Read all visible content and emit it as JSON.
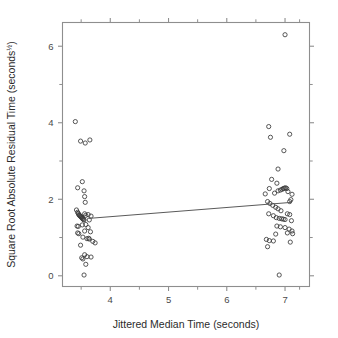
{
  "figure": {
    "width": 338,
    "height": 338,
    "background": "#ffffff",
    "point_color": "#3a3a3a",
    "line_color": "#5a5a5a",
    "axis_color": "#8e8e8e"
  },
  "chart_data": {
    "type": "scatter",
    "title": "",
    "xlabel": "Jittered Median Time (seconds)",
    "ylabel": "Square Root Absolute Residual Time (seconds",
    "ylabel_superscript": "½",
    "ylabel_suffix": ")",
    "xlim": [
      3.18,
      7.42
    ],
    "ylim": [
      -0.28,
      6.62
    ],
    "xticks": [
      4,
      5,
      6,
      7
    ],
    "xtick_labels": [
      "4",
      "5",
      "6",
      "7"
    ],
    "xticks_minor": [
      3.5,
      4.5,
      5.5,
      6.5,
      7.25
    ],
    "yticks": [
      0,
      2,
      4,
      6
    ],
    "ytick_labels": [
      "0",
      "2",
      "4",
      "6"
    ],
    "yticks_minor": [
      1,
      3,
      5
    ],
    "grid": false,
    "legend": null,
    "marker": "open-circle",
    "marker_radius_px": 2.1,
    "tick_direction": "outward",
    "frame": "box",
    "series": [
      {
        "name": "observations",
        "points": [
          [
            3.4,
            4.03
          ],
          [
            3.49,
            3.52
          ],
          [
            3.57,
            3.47
          ],
          [
            3.65,
            3.55
          ],
          [
            3.44,
            2.3
          ],
          [
            3.52,
            2.46
          ],
          [
            3.55,
            2.22
          ],
          [
            3.56,
            2.07
          ],
          [
            3.57,
            1.92
          ],
          [
            3.42,
            1.72
          ],
          [
            3.44,
            1.66
          ],
          [
            3.45,
            1.63
          ],
          [
            3.46,
            1.6
          ],
          [
            3.47,
            1.58
          ],
          [
            3.48,
            1.57
          ],
          [
            3.49,
            1.55
          ],
          [
            3.5,
            1.54
          ],
          [
            3.51,
            1.52
          ],
          [
            3.52,
            1.5
          ],
          [
            3.53,
            1.49
          ],
          [
            3.54,
            1.47
          ],
          [
            3.55,
            1.46
          ],
          [
            3.56,
            1.62
          ],
          [
            3.58,
            1.58
          ],
          [
            3.62,
            1.6
          ],
          [
            3.64,
            1.46
          ],
          [
            3.67,
            1.56
          ],
          [
            3.43,
            1.3
          ],
          [
            3.45,
            1.29
          ],
          [
            3.52,
            1.33
          ],
          [
            3.58,
            1.34
          ],
          [
            3.62,
            1.26
          ],
          [
            3.44,
            1.12
          ],
          [
            3.46,
            1.1
          ],
          [
            3.56,
            1.17
          ],
          [
            3.66,
            1.15
          ],
          [
            3.53,
            1.01
          ],
          [
            3.6,
            0.97
          ],
          [
            3.63,
            0.98
          ],
          [
            3.64,
            0.96
          ],
          [
            3.7,
            0.9
          ],
          [
            3.74,
            0.86
          ],
          [
            3.49,
            0.8
          ],
          [
            3.56,
            0.55
          ],
          [
            3.51,
            0.47
          ],
          [
            3.53,
            0.44
          ],
          [
            3.6,
            0.5
          ],
          [
            3.67,
            0.49
          ],
          [
            3.58,
            0.3
          ],
          [
            3.55,
            0.02
          ],
          [
            6.72,
            3.9
          ],
          [
            6.75,
            3.62
          ],
          [
            7.08,
            3.7
          ],
          [
            6.98,
            3.27
          ],
          [
            6.88,
            2.79
          ],
          [
            6.77,
            2.52
          ],
          [
            6.86,
            2.42
          ],
          [
            6.73,
            2.28
          ],
          [
            6.66,
            2.14
          ],
          [
            6.82,
            2.16
          ],
          [
            6.88,
            2.22
          ],
          [
            6.92,
            2.24
          ],
          [
            6.95,
            2.26
          ],
          [
            6.97,
            2.28
          ],
          [
            6.99,
            2.29
          ],
          [
            7.01,
            2.3
          ],
          [
            7.03,
            2.28
          ],
          [
            7.05,
            2.2
          ],
          [
            7.12,
            2.13
          ],
          [
            7.1,
            1.99
          ],
          [
            7.08,
            1.94
          ],
          [
            6.7,
            1.94
          ],
          [
            6.74,
            1.89
          ],
          [
            6.79,
            1.84
          ],
          [
            6.84,
            1.79
          ],
          [
            6.88,
            1.75
          ],
          [
            6.93,
            1.7
          ],
          [
            6.72,
            1.62
          ],
          [
            6.8,
            1.57
          ],
          [
            6.85,
            1.52
          ],
          [
            6.9,
            1.5
          ],
          [
            6.94,
            1.49
          ],
          [
            6.97,
            1.48
          ],
          [
            7.0,
            1.47
          ],
          [
            7.04,
            1.62
          ],
          [
            7.08,
            1.6
          ],
          [
            7.11,
            1.44
          ],
          [
            6.86,
            1.3
          ],
          [
            6.92,
            1.28
          ],
          [
            7.0,
            1.26
          ],
          [
            7.07,
            1.22
          ],
          [
            7.12,
            1.17
          ],
          [
            6.84,
            1.09
          ],
          [
            7.04,
            1.12
          ],
          [
            7.13,
            1.1
          ],
          [
            6.68,
            0.95
          ],
          [
            6.73,
            0.92
          ],
          [
            6.8,
            0.91
          ],
          [
            7.09,
            0.88
          ],
          [
            6.7,
            0.76
          ],
          [
            6.9,
            0.02
          ],
          [
            7.0,
            6.3
          ]
        ]
      }
    ],
    "fit_line": {
      "name": "least-squares-fit",
      "x_start": 3.63,
      "y_start": 1.5,
      "x_end": 7.12,
      "y_end": 1.92
    }
  }
}
